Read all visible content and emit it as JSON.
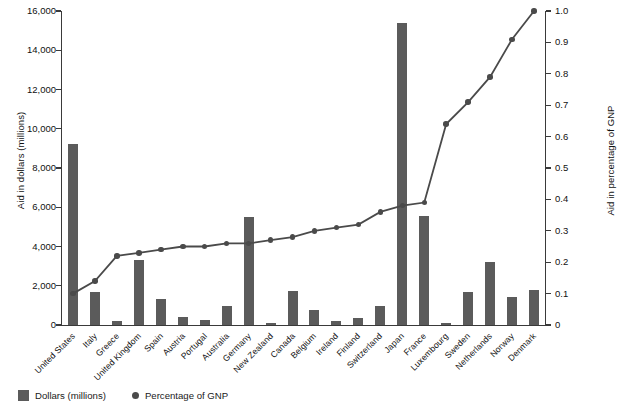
{
  "chart_data": {
    "type": "bar",
    "title": "",
    "subtitle": "",
    "xlabel": "",
    "ylabel": "Aid in dollars (millions)",
    "y2label": "Aid in percentage of GNP",
    "ylim": [
      0,
      16000
    ],
    "y2lim": [
      0,
      1.0
    ],
    "grid": false,
    "legend_position": "bottom-left",
    "y_ticks": [
      "0",
      "2,000",
      "4,000",
      "6,000",
      "8,000",
      "10,000",
      "12,000",
      "14,000",
      "16,000"
    ],
    "y_tick_values": [
      0,
      2000,
      4000,
      6000,
      8000,
      10000,
      12000,
      14000,
      16000
    ],
    "y2_ticks": [
      "0",
      "0.1",
      "0.2",
      "0.3",
      "0.4",
      "0.5",
      "0.6",
      "0.7",
      "0.8",
      "0.9",
      "1.0"
    ],
    "y2_tick_values": [
      0,
      0.1,
      0.2,
      0.3,
      0.4,
      0.5,
      0.6,
      0.7,
      0.8,
      0.9,
      1.0
    ],
    "categories": [
      "United States",
      "Italy",
      "Greece",
      "United Kingdom",
      "Spain",
      "Austria",
      "Portugal",
      "Australia",
      "Germany",
      "New Zealand",
      "Canada",
      "Belgium",
      "Ireland",
      "Finland",
      "Switzerland",
      "Japan",
      "France",
      "Luxembourg",
      "Sweden",
      "Netherlands",
      "Norway",
      "Denmark"
    ],
    "series": [
      {
        "name": "Dollars (millions)",
        "axis": "left",
        "render": "bar",
        "color": "#5b5b5b",
        "values": [
          9200,
          1700,
          200,
          3300,
          1350,
          400,
          250,
          950,
          5500,
          110,
          1750,
          760,
          200,
          370,
          950,
          15400,
          5550,
          100,
          1700,
          3200,
          1450,
          1800
        ]
      },
      {
        "name": "Percentage of GNP",
        "axis": "right",
        "render": "line",
        "color": "#4a4a4a",
        "values": [
          0.1,
          0.14,
          0.22,
          0.23,
          0.24,
          0.25,
          0.25,
          0.26,
          0.26,
          0.27,
          0.28,
          0.3,
          0.31,
          0.32,
          0.36,
          0.38,
          0.39,
          0.64,
          0.71,
          0.79,
          0.91,
          1.0
        ]
      }
    ],
    "legend": [
      {
        "label": "Dollars (millions)",
        "marker": "square",
        "color": "#5b5b5b"
      },
      {
        "label": "Percentage of GNP",
        "marker": "dot",
        "color": "#4a4a4a"
      }
    ]
  }
}
